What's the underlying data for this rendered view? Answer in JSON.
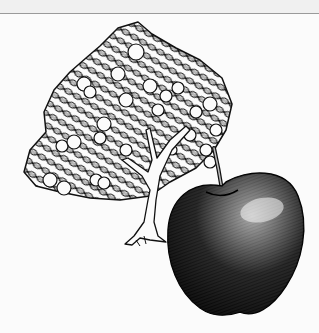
{
  "image": {
    "alt": "Pen-and-ink illustration of an orange tree with round fruits and a large shaded apple in the foreground",
    "subjects": [
      "orange-tree",
      "apple"
    ],
    "style": "black ink cross-hatching on white",
    "colors": {
      "ink": "#111111",
      "paper": "#fbfbfb",
      "band": "#f0f0f0",
      "rule": "#9a9a9a"
    }
  }
}
